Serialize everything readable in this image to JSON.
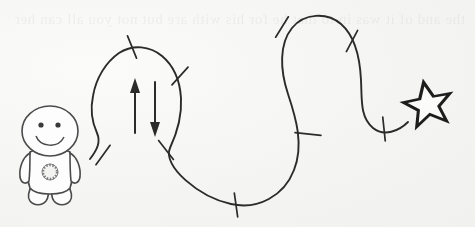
{
  "scene": {
    "title": "Hand-drawn winding path from character to star",
    "width": 475,
    "height": 227,
    "background_color": "#f4f4f3",
    "ink_color": "#2b2b2b",
    "medium": "pen on paper",
    "ghost_text": "the and of it was in to that he for his with are but not you all can her",
    "caption": ""
  },
  "character": {
    "name": "smiley-figure",
    "label": "",
    "expression": "smiling",
    "eye_count": 2,
    "has_badge": true,
    "badge_label": "",
    "fill_color": "#fdfdfd",
    "outline_color": "#4a4a4a"
  },
  "goal": {
    "name": "star-marker",
    "label": "",
    "shape": "five-pointed-star",
    "fill_color": "#1d1d1d",
    "inner_color": "#fbfbfa",
    "points": 5
  },
  "path": {
    "name": "winding-path",
    "stroke_color": "#2b2b2b",
    "stroke_width": 1.9,
    "description": "S-curve route with cross tick marks",
    "d": "M 90 159 C 97 150 101 142 97 133 C 92 122 90 110 93 96 C 96 78 106 62 119 53 C 133 44 150 46 162 56 C 174 66 180 82 181 98 C 182 116 177 133 170 148 C 162 166 199 197 231 204 C 258 210 284 196 294 170 C 304 145 296 118 288 94 C 280 70 279 44 292 28 C 304 13 327 12 341 24 C 356 37 360 59 361 80 C 362 100 360 117 373 128 C 384 137 399 131 408 122"
  },
  "ticks": {
    "name": "path-tick-marks",
    "count": 9,
    "stroke_color": "#2b2b2b",
    "marks": [
      {
        "x": 132,
        "y": 47,
        "angle": 68,
        "length": 24
      },
      {
        "x": 180,
        "y": 76,
        "angle": 132,
        "length": 24
      },
      {
        "x": 103,
        "y": 155,
        "angle": 126,
        "length": 24
      },
      {
        "x": 166,
        "y": 150,
        "angle": 52,
        "length": 24
      },
      {
        "x": 236,
        "y": 205,
        "angle": 82,
        "length": 24
      },
      {
        "x": 308,
        "y": 134,
        "angle": 6,
        "length": 26
      },
      {
        "x": 282,
        "y": 27,
        "angle": 122,
        "length": 24
      },
      {
        "x": 352,
        "y": 41,
        "angle": 118,
        "length": 24
      },
      {
        "x": 384,
        "y": 129,
        "angle": 84,
        "length": 24
      }
    ]
  },
  "arrows": [
    {
      "name": "arrow-up",
      "direction": "up",
      "label": "",
      "x": 135,
      "y_start": 133,
      "y_end": 82,
      "color": "#2b2b2b"
    },
    {
      "name": "arrow-down",
      "direction": "down",
      "label": "",
      "x": 155,
      "y_start": 82,
      "y_end": 133,
      "color": "#2b2b2b"
    }
  ]
}
